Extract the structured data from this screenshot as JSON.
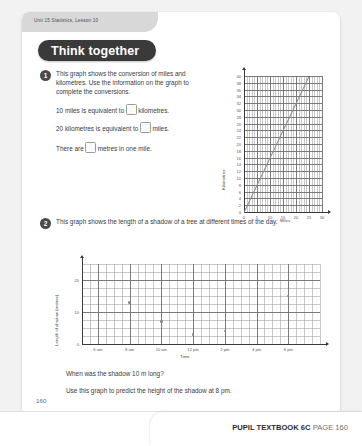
{
  "header": {
    "unit_tab": "Unit 15  Statistics, Lesson 10",
    "banner": "Think together"
  },
  "questions": [
    {
      "number": "1",
      "intro": "This graph shows the conversion of miles and kilometres. Use the information on the graph to complete the conversions.",
      "line1_pre": "10 miles is equivalent to",
      "line1_post": "kilometres.",
      "line2_pre": "20 kilometres is equivalent to",
      "line2_post": "miles.",
      "line3_pre": "There are",
      "line3_post": "metres in one mile."
    },
    {
      "number": "2",
      "intro": "This graph shows the length of a shadow of a tree at different times of the day.",
      "sub1": "When was the shadow 10 m long?",
      "sub2": "Use this graph to predict the height of the shadow at 8 pm."
    }
  ],
  "chart_data": [
    {
      "type": "line",
      "title": "",
      "xlabel": "Miles",
      "ylabel": "Kilometres",
      "xlim": [
        0,
        30
      ],
      "ylim": [
        0,
        40
      ],
      "xticks": [
        0,
        5,
        10,
        15,
        20,
        25,
        30
      ],
      "yticks": [
        0,
        2,
        4,
        6,
        8,
        10,
        12,
        14,
        16,
        18,
        20,
        22,
        24,
        26,
        28,
        30,
        32,
        34,
        36,
        38,
        40
      ],
      "xtick_labels": [
        "0",
        "5",
        "10",
        "15",
        "20",
        "25",
        "30"
      ],
      "ytick_labels": [
        "0",
        "2",
        "4",
        "6",
        "8",
        "10",
        "12",
        "14",
        "16",
        "18",
        "20",
        "22",
        "24",
        "26",
        "28",
        "30",
        "32",
        "34",
        "36",
        "38",
        "40"
      ],
      "grid": true,
      "series": [
        {
          "name": "miles to kilometres",
          "x": [
            0,
            25
          ],
          "values": [
            0,
            40
          ]
        }
      ]
    },
    {
      "type": "scatter",
      "title": "",
      "xlabel": "Time",
      "ylabel": "Length of shadow (metres)",
      "xlim": [
        5,
        20
      ],
      "ylim": [
        0,
        25
      ],
      "xticks": [
        6,
        8,
        10,
        12,
        14,
        16,
        18
      ],
      "xtick_labels": [
        "6 am",
        "8 am",
        "10 am",
        "12 pm",
        "2 pm",
        "4 pm",
        "6 pm"
      ],
      "yticks": [
        0,
        10,
        20
      ],
      "ytick_labels": [
        "0",
        "10",
        "20"
      ],
      "grid": true,
      "series": [
        {
          "name": "shadow length",
          "points": [
            {
              "x": 8,
              "y": 13
            },
            {
              "x": 10,
              "y": 7
            },
            {
              "x": 12,
              "y": 3
            },
            {
              "x": 14,
              "y": 4
            },
            {
              "x": 18,
              "y": 15
            }
          ]
        }
      ]
    }
  ],
  "footer": {
    "page_number": "160",
    "book": "PUPIL TEXTBOOK 6C",
    "page_label": "PAGE 160"
  }
}
